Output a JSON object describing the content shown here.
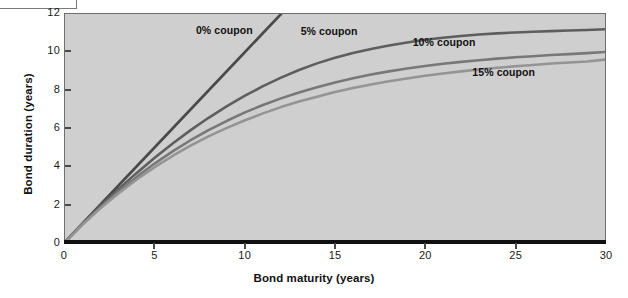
{
  "figure": {
    "background_color": "#ffffff",
    "plot_background_color": "#cfcfcf",
    "plot_border_color": "#6e6e6e",
    "axis_color": "#111111"
  },
  "chart_data": {
    "type": "line",
    "title": "",
    "subtitle": "",
    "xlabel": "Bond maturity (years)",
    "ylabel": "Bond duration (years)",
    "xlim": [
      0,
      30
    ],
    "ylim": [
      0,
      12
    ],
    "xticks": [
      0,
      5,
      10,
      15,
      20,
      25,
      30
    ],
    "yticks": [
      0,
      2,
      4,
      6,
      8,
      10,
      12
    ],
    "xtick_labels": [
      "0",
      "5",
      "10",
      "15",
      "20",
      "25",
      "30"
    ],
    "ytick_labels": [
      "0",
      "2",
      "4",
      "6",
      "8",
      "10",
      "12"
    ],
    "grid": false,
    "legend_position": "inline-annotations",
    "x": [
      0,
      1,
      2,
      3,
      4,
      5,
      6,
      7,
      8,
      9,
      10,
      11,
      12,
      13,
      14,
      15,
      16,
      17,
      18,
      19,
      20,
      21,
      22,
      23,
      24,
      25,
      26,
      27,
      28,
      29,
      30
    ],
    "series": [
      {
        "name": "0% coupon",
        "color": "#4a4a4a",
        "label": "0% coupon",
        "label_x": 7.3,
        "label_y": 11.05,
        "values": [
          0,
          1,
          2,
          3,
          4,
          5,
          6,
          7,
          8,
          9,
          10,
          11,
          12,
          13,
          14,
          15,
          16,
          17,
          18,
          19,
          20,
          21,
          22,
          23,
          24,
          25,
          26,
          27,
          28,
          29,
          30
        ],
        "clipped_at_top": true
      },
      {
        "name": "5% coupon",
        "color": "#5e5e5e",
        "label": "5% coupon",
        "label_x": 13.1,
        "label_y": 11.0,
        "values": [
          0,
          0.98,
          1.92,
          2.81,
          3.65,
          4.45,
          5.2,
          5.9,
          6.55,
          7.15,
          7.7,
          8.2,
          8.65,
          9.05,
          9.4,
          9.7,
          9.95,
          10.16,
          10.34,
          10.5,
          10.64,
          10.75,
          10.84,
          10.92,
          10.98,
          11.03,
          11.07,
          11.1,
          11.13,
          11.16,
          11.2
        ]
      },
      {
        "name": "10% coupon",
        "color": "#787878",
        "label": "10% coupon",
        "label_x": 19.3,
        "label_y": 10.45,
        "values": [
          0,
          0.96,
          1.85,
          2.68,
          3.44,
          4.14,
          4.78,
          5.37,
          5.9,
          6.38,
          6.82,
          7.21,
          7.56,
          7.87,
          8.15,
          8.4,
          8.62,
          8.81,
          8.98,
          9.13,
          9.26,
          9.38,
          9.48,
          9.57,
          9.65,
          9.72,
          9.78,
          9.84,
          9.89,
          9.94,
          10.0
        ]
      },
      {
        "name": "15% coupon",
        "color": "#949494",
        "label": "15% coupon",
        "label_x": 22.6,
        "label_y": 8.85,
        "values": [
          0,
          0.94,
          1.8,
          2.58,
          3.3,
          3.95,
          4.54,
          5.08,
          5.57,
          6.01,
          6.41,
          6.77,
          7.1,
          7.39,
          7.65,
          7.89,
          8.1,
          8.29,
          8.46,
          8.61,
          8.75,
          8.87,
          8.98,
          9.08,
          9.17,
          9.25,
          9.32,
          9.39,
          9.45,
          9.5,
          9.6
        ]
      }
    ]
  }
}
